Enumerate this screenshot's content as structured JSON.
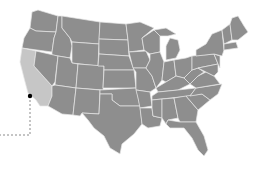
{
  "map": {
    "region": "United States (contiguous)",
    "colors": {
      "state_fill": "#8e8e8e",
      "highlight_fill": "#c6c6c6",
      "border": "#e6e6e6",
      "marker": "#000000",
      "leader_line": "#8a8a8a"
    },
    "highlighted_state": "California",
    "marker": {
      "icon": "location-dot-icon",
      "approx_location": "Los Angeles area, California"
    }
  }
}
